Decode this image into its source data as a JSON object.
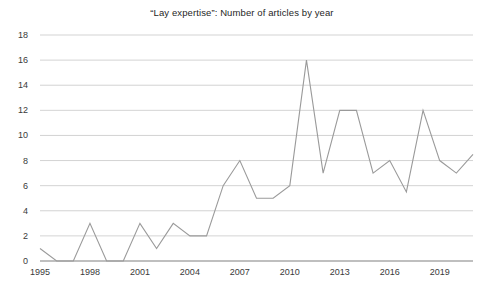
{
  "chart_data": {
    "type": "line",
    "title": "“Lay expertise”: Number of articles by year",
    "xlabel": "",
    "ylabel": "",
    "xlim": [
      1995,
      2021
    ],
    "ylim": [
      0,
      18
    ],
    "ytick_step": 2,
    "xtick_step": 3,
    "grid": "horizontal",
    "legend": "none",
    "line_color": "#9a9a9a",
    "grid_color": "#c8c8c8",
    "axis_color": "#808080",
    "background_color": "#ffffff",
    "x": [
      1995,
      1996,
      1997,
      1998,
      1999,
      2000,
      2001,
      2002,
      2003,
      2004,
      2005,
      2006,
      2007,
      2008,
      2009,
      2010,
      2011,
      2012,
      2013,
      2014,
      2015,
      2016,
      2017,
      2018,
      2019,
      2020,
      2021
    ],
    "values": [
      1,
      0,
      0,
      3,
      0,
      0,
      3,
      1,
      3,
      2,
      2,
      6,
      8,
      5,
      5,
      6,
      16,
      7,
      12,
      12,
      7,
      8,
      5.5,
      12,
      8,
      7,
      8.5
    ],
    "categories": [
      "1995",
      "1996",
      "1997",
      "1998",
      "1999",
      "2000",
      "2001",
      "2002",
      "2003",
      "2004",
      "2005",
      "2006",
      "2007",
      "2008",
      "2009",
      "2010",
      "2011",
      "2012",
      "2013",
      "2014",
      "2015",
      "2016",
      "2017",
      "2018",
      "2019",
      "2020",
      "2021"
    ],
    "series": [
      {
        "name": "Number of articles",
        "values": [
          1,
          0,
          0,
          3,
          0,
          0,
          3,
          1,
          3,
          2,
          2,
          6,
          8,
          5,
          5,
          6,
          16,
          7,
          12,
          12,
          7,
          8,
          5.5,
          12,
          8,
          7,
          8.5
        ]
      }
    ],
    "ytick_labels": [
      "0",
      "2",
      "4",
      "6",
      "8",
      "10",
      "12",
      "14",
      "16",
      "18"
    ],
    "ytick_values": [
      0,
      2,
      4,
      6,
      8,
      10,
      12,
      14,
      16,
      18
    ],
    "xtick_labels": [
      "1995",
      "1998",
      "2001",
      "2004",
      "2007",
      "2010",
      "2013",
      "2016",
      "2019"
    ],
    "xtick_values": [
      1995,
      1998,
      2001,
      2004,
      2007,
      2010,
      2013,
      2016,
      2019
    ]
  }
}
